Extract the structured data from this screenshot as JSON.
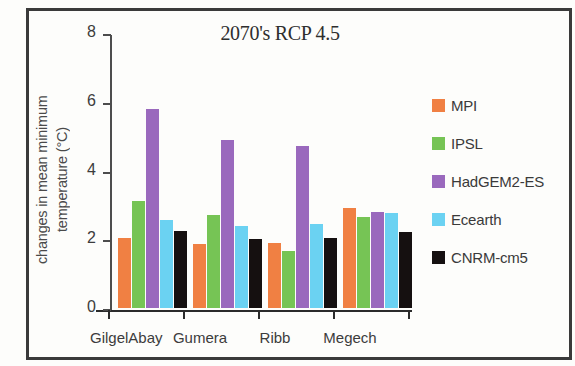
{
  "chart_data": {
    "type": "bar",
    "title": "2070's RCP 4.5",
    "xlabel": "",
    "ylabel": "changes in mean minimum temperature (°C)",
    "ylabel_line1": "changes in mean minimum",
    "ylabel_line2": "temperature (°C)",
    "categories": [
      "GilgelAbay",
      "Gumera",
      "Ribb",
      "Megech"
    ],
    "series": [
      {
        "name": "MPI",
        "color": "#f08043",
        "values": [
          2.05,
          1.85,
          1.9,
          2.9
        ]
      },
      {
        "name": "IPSL",
        "color": "#76c455",
        "values": [
          3.1,
          2.7,
          1.65,
          2.65
        ]
      },
      {
        "name": "HadGEM2-ES",
        "color": "#9a69bd",
        "values": [
          5.8,
          4.9,
          4.7,
          2.8
        ]
      },
      {
        "name": "Ecearth",
        "color": "#6bd2f2",
        "values": [
          2.55,
          2.4,
          2.45,
          2.75
        ]
      },
      {
        "name": "CNRM-cm5",
        "color": "#151010",
        "values": [
          2.25,
          2.0,
          2.05,
          2.2
        ]
      }
    ],
    "ylim": [
      0,
      8
    ],
    "yticks": [
      0,
      2,
      4,
      6,
      8
    ],
    "ytick_labels": [
      "0",
      "2",
      "4",
      "6",
      "8"
    ],
    "grid": false,
    "legend_position": "right"
  }
}
